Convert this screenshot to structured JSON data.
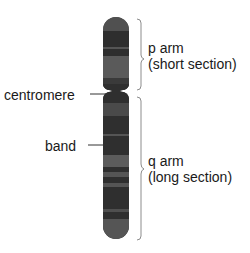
{
  "labels": {
    "centromere": "centromere",
    "band": "band",
    "p_arm_line1": "p arm",
    "p_arm_line2": "(short section)",
    "q_arm_line1": "q arm",
    "q_arm_line2": "(long section)"
  },
  "colors": {
    "dark_band": "#2f2f2f",
    "mid_band": "#4a4a4a",
    "light_band": "#5e5e5e",
    "outline": "#1e1e1e",
    "text": "#1a1a1a",
    "bracket": "#9a9a9a"
  }
}
